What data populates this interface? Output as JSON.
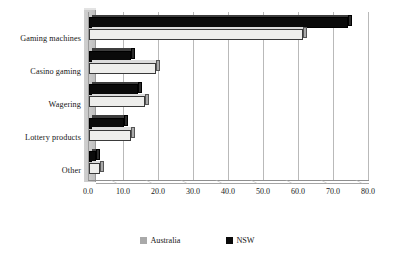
{
  "chart_data": {
    "type": "bar",
    "orientation": "horizontal",
    "title": "",
    "subtitle": "",
    "xlabel": "",
    "ylabel": "",
    "categories": [
      "Gaming machines",
      "Casino gaming",
      "Wagering",
      "Lottery products",
      "Other"
    ],
    "series": [
      {
        "name": "Australia",
        "color": "#eeeeec",
        "values": [
          61.0,
          19.0,
          16.0,
          12.0,
          3.0
        ]
      },
      {
        "name": "NSW",
        "color": "#0a0a0a",
        "values": [
          74.0,
          12.0,
          14.0,
          10.0,
          2.0
        ]
      }
    ],
    "xlim": [
      0.0,
      80.0
    ],
    "xticks": [
      "0.0",
      "10.0",
      "20.0",
      "30.0",
      "40.0",
      "50.0",
      "60.0",
      "70.0",
      "80.0"
    ],
    "xtick_values": [
      0,
      10,
      20,
      30,
      40,
      50,
      60,
      70,
      80
    ],
    "grid": true,
    "grid_axis": "x",
    "legend_position": "bottom",
    "style": "3d-bar"
  },
  "legend": {
    "items": [
      {
        "label": "Australia",
        "color": "#a9a9a9"
      },
      {
        "label": "NSW",
        "color": "#0a0a0a"
      }
    ]
  }
}
